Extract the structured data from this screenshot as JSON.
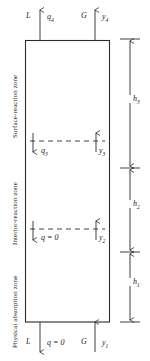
{
  "figure": {
    "type": "process-schematic"
  },
  "zones": [
    {
      "id": "surface-reaction",
      "label": "Surface-reaction zone"
    },
    {
      "id": "interior-reaction",
      "label": "Interior-reaction zone"
    },
    {
      "id": "physical-absorption",
      "label": "Physical absorption zone"
    }
  ],
  "streams": {
    "top": {
      "liquid": {
        "symbol": "L",
        "direction": "down",
        "value": "q",
        "sub": "4"
      },
      "gas": {
        "symbol": "G",
        "direction": "up",
        "value": "y",
        "sub": "4"
      }
    },
    "boundary_3": {
      "liquid": {
        "direction": "down",
        "value": "q",
        "sub": "3"
      },
      "gas": {
        "direction": "up",
        "value": "y",
        "sub": "3"
      }
    },
    "boundary_2": {
      "liquid": {
        "direction": "down",
        "value": "q = 0",
        "sub": ""
      },
      "gas": {
        "direction": "up",
        "value": "y",
        "sub": "2"
      }
    },
    "bottom": {
      "liquid": {
        "symbol": "L",
        "direction": "down",
        "value": "q = 0",
        "sub": ""
      },
      "gas": {
        "symbol": "G",
        "direction": "up",
        "value": "y",
        "sub": "1"
      }
    }
  },
  "dimensions": [
    {
      "id": "h3",
      "label": "h",
      "sub": "3"
    },
    {
      "id": "h2",
      "label": "h",
      "sub": "2"
    },
    {
      "id": "h1",
      "label": "h",
      "sub": "1"
    }
  ],
  "colors": {
    "stroke": "#2b2b2b",
    "background": "#ffffff",
    "text": "#1a1a1a"
  }
}
